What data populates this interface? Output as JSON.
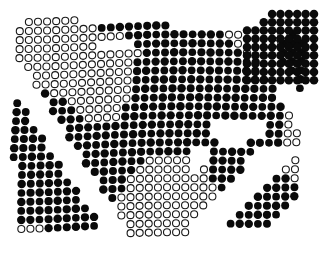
{
  "artwork": {
    "title": "halftone-dot-field",
    "type": "abstract-dot-pattern",
    "canvas": {
      "width": 329,
      "height": 256
    },
    "background_color": "#ffffff",
    "dot_fill_color": "#0a0a0a",
    "dot_stroke_color": "#1a1a1a",
    "grid": {
      "pitch_x": 9.1,
      "pitch_y": 9.0,
      "dot_diameter": 8.1,
      "hollow_stroke_width": 1.1,
      "row_stagger_px": 0.0,
      "row_shear_per_row": -0.26,
      "col_wave_amplitude": 1.6
    },
    "margins": {
      "top": 12,
      "right": 12,
      "bottom": 16,
      "left": 10
    },
    "description": "Dense field of halftone dots on white; dots are either solid black or hollow outlined circles, arranged on a gently sheared / warped lattice. Solid regions form large swooping bands across upper-left, lower-left and right; hollow circles form diagonal ribbons through the centre and upper-right.",
    "regions": [
      {
        "name": "upper-left-solid-band",
        "state": "filled"
      },
      {
        "name": "upper-centre-hollow-ribbon",
        "state": "hollow"
      },
      {
        "name": "upper-right-solid-block",
        "state": "filled"
      },
      {
        "name": "centre-hollow-diagonal",
        "state": "hollow"
      },
      {
        "name": "centre-solid-wedge",
        "state": "filled"
      },
      {
        "name": "mid-right-horizontal-bars",
        "state": "filled"
      },
      {
        "name": "lower-left-solid-mass",
        "state": "filled"
      },
      {
        "name": "lower-right-sparse-dots",
        "state": "filled"
      },
      {
        "name": "right-hollow-column",
        "state": "hollow"
      }
    ]
  },
  "chart_data": {
    "type": "scatter",
    "xlabel": "",
    "ylabel": "",
    "xlim": [
      0,
      329
    ],
    "ylim": [
      0,
      256
    ],
    "grid": false,
    "legend": null,
    "series": [
      {
        "name": "solid-dots",
        "marker": "filled-circle",
        "color": "#0a0a0a"
      },
      {
        "name": "hollow-dots",
        "marker": "open-circle",
        "color": "#1a1a1a"
      }
    ]
  }
}
